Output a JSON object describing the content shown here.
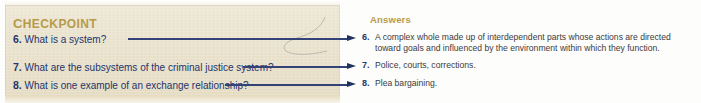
{
  "panel": {
    "heading": "Checkpoint",
    "questions": [
      {
        "num": "6.",
        "text": "What is a system?"
      },
      {
        "num": "7.",
        "text": "What are the subsystems of the criminal justice system?"
      },
      {
        "num": "8.",
        "text": "What is one example of an exchange relationship?"
      }
    ]
  },
  "answers_column": {
    "heading": "Answers",
    "items": [
      {
        "num": "6.",
        "line1": "A complex whole made up of interdependent parts whose actions are directed",
        "line2": "toward goals and influenced by the environment within which they function."
      },
      {
        "num": "7.",
        "line1": "Police, courts, corrections.",
        "line2": ""
      },
      {
        "num": "8.",
        "line1": "Plea bargaining.",
        "line2": ""
      }
    ]
  },
  "connectors": [
    {
      "name": "arrow-question-6",
      "label": "arrow-right-icon"
    },
    {
      "name": "arrow-question-7",
      "label": "arrow-right-icon"
    },
    {
      "name": "arrow-question-8",
      "label": "arrow-right-icon"
    }
  ],
  "colors": {
    "heading_gold": "#b79b4a",
    "question_navy": "#24356b",
    "arrow_navy": "#22325f",
    "answer_text": "#3b3b40",
    "panel_tan": "#ebe4d0",
    "page_white": "#fdfdfb"
  }
}
